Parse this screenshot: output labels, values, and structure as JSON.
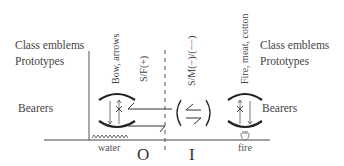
{
  "left_labels": {
    "class_emblems": "Class emblems",
    "prototypes": "Prototypes",
    "bearers": "Bearers"
  },
  "right_labels": {
    "class_emblems": "Class emblems",
    "prototypes": "Prototypes",
    "bearers": "Bearers"
  },
  "columns": {
    "left_emblem": "Bow, arrows",
    "exchange_sf": "S/F(+)",
    "exchange_sm": "S/M(−)/(−−)",
    "right_emblem": "Fire, meat, cotton"
  },
  "bottom_labels": {
    "water": "water",
    "outside": "O",
    "inside": "I",
    "fire": "fire"
  },
  "colors": {
    "ink": "#3a3a3a",
    "background": "#ffffff"
  }
}
